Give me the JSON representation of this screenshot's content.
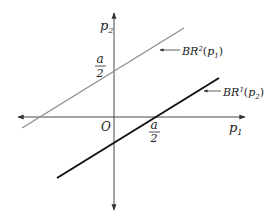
{
  "diagram": {
    "axes": {
      "x_label": "p",
      "x_label_sub": "1",
      "y_label": "p",
      "y_label_sub": "2",
      "origin_label": "O"
    },
    "ticks": {
      "y_intercept": {
        "numerator": "a",
        "denominator": "2"
      },
      "x_intercept": {
        "numerator": "a",
        "denominator": "2"
      }
    },
    "lines": [
      {
        "name": "BR2",
        "label_main": "BR",
        "label_sup": "2",
        "label_arg": "p",
        "label_arg_sub": "1",
        "color": "#8a8a8a"
      },
      {
        "name": "BR1",
        "label_main": "BR",
        "label_sup": "1",
        "label_arg": "p",
        "label_arg_sub": "2",
        "color": "#111111"
      }
    ],
    "colors": {
      "axis": "#333333",
      "background": "#ffffff"
    }
  }
}
